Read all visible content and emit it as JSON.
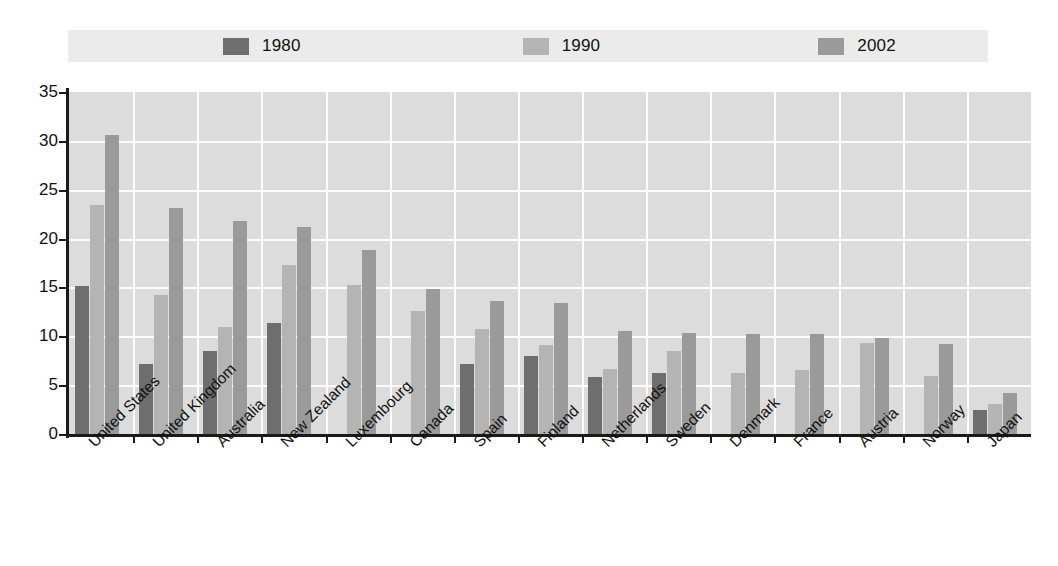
{
  "chart_data": {
    "type": "bar",
    "title": "",
    "subtitle": "",
    "xlabel": "",
    "ylabel": "",
    "ylim": [
      0,
      35
    ],
    "yticks": [
      0,
      5,
      10,
      15,
      20,
      25,
      30,
      35
    ],
    "grid": true,
    "legend_position": "top",
    "categories": [
      "United States",
      "United Kingdom",
      "Australia",
      "New Zealand",
      "Luxembourg",
      "Canada",
      "Spain",
      "Finland",
      "Netherlands",
      "Sweden",
      "Denmark",
      "France",
      "Austria",
      "Norway",
      "Japan"
    ],
    "series": [
      {
        "name": "1980",
        "color": "#6e6e6e",
        "values": [
          15.1,
          7.2,
          8.5,
          11.4,
          null,
          null,
          7.2,
          8.0,
          5.8,
          6.2,
          null,
          null,
          null,
          null,
          2.5
        ]
      },
      {
        "name": "1990",
        "color": "#b4b4b4",
        "values": [
          23.4,
          14.2,
          11.0,
          17.3,
          15.3,
          12.6,
          10.7,
          9.1,
          6.7,
          8.5,
          6.2,
          6.6,
          9.3,
          5.9,
          3.1
        ]
      },
      {
        "name": "2002",
        "color": "#9a9a9a",
        "values": [
          30.6,
          23.1,
          21.8,
          21.2,
          18.8,
          14.8,
          13.6,
          13.4,
          10.5,
          10.3,
          10.2,
          10.2,
          9.8,
          9.2,
          4.2
        ]
      }
    ]
  },
  "legend": {
    "items": [
      {
        "label": "1980",
        "color": "#6e6e6e"
      },
      {
        "label": "1990",
        "color": "#b4b4b4"
      },
      {
        "label": "2002",
        "color": "#9a9a9a"
      }
    ],
    "background": "#ebebeb"
  },
  "axes": {
    "y_tick_labels": [
      "0",
      "5",
      "10",
      "15",
      "20",
      "25",
      "30",
      "35"
    ],
    "plot_background": "#dcdcdc",
    "grid_color": "#fdfdfd",
    "axis_color": "#1a1a1a"
  }
}
